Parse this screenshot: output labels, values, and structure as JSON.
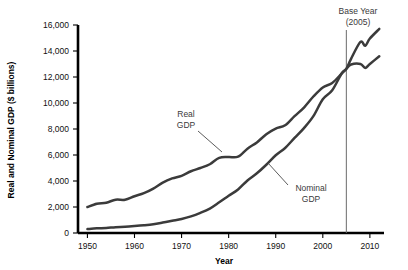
{
  "chart_data": {
    "type": "line",
    "title": "",
    "xlabel": "Year",
    "ylabel": "Real and Nominal GDP ($ billions)",
    "xlim": [
      1948,
      2013
    ],
    "ylim": [
      0,
      16000
    ],
    "xticks": [
      1950,
      1960,
      1970,
      1980,
      1990,
      2000,
      2010
    ],
    "xtick_labels": [
      "1950",
      "1960",
      "1970",
      "1980",
      "1990",
      "2000",
      "2010"
    ],
    "yticks": [
      0,
      2000,
      4000,
      6000,
      8000,
      10000,
      12000,
      14000,
      16000
    ],
    "ytick_labels": [
      "0",
      "2,000",
      "4,000",
      "6,000",
      "8,000",
      "10,000",
      "12,000",
      "14,000",
      "16,000"
    ],
    "grid": false,
    "legend_position": "inline-annotations",
    "line_color": "#3b3b3b",
    "reference_line_color": "#6a6a6a",
    "annotations": [
      {
        "name": "base-year",
        "text_line1": "Base Year",
        "text_line2": "(2005)",
        "x": 2005
      },
      {
        "name": "real-gdp",
        "text_line1": "Real",
        "text_line2": "GDP"
      },
      {
        "name": "nominal-gdp",
        "text_line1": "Nominal",
        "text_line2": "GDP"
      }
    ],
    "series": [
      {
        "name": "Real GDP",
        "x": [
          1950,
          1952,
          1954,
          1956,
          1958,
          1960,
          1962,
          1964,
          1966,
          1968,
          1970,
          1972,
          1974,
          1976,
          1978,
          1980,
          1982,
          1984,
          1986,
          1988,
          1990,
          1992,
          1994,
          1996,
          1998,
          2000,
          2002,
          2004,
          2005,
          2006,
          2008,
          2009,
          2010,
          2012
        ],
        "values": [
          2000,
          2250,
          2330,
          2560,
          2560,
          2830,
          3070,
          3420,
          3880,
          4200,
          4400,
          4750,
          5000,
          5290,
          5780,
          5840,
          5870,
          6490,
          6970,
          7600,
          8030,
          8290,
          8990,
          9650,
          10500,
          11200,
          11540,
          12260,
          12620,
          12960,
          13000,
          12700,
          13000,
          13600
        ]
      },
      {
        "name": "Nominal GDP",
        "x": [
          1950,
          1952,
          1954,
          1956,
          1958,
          1960,
          1962,
          1964,
          1966,
          1968,
          1970,
          1972,
          1974,
          1976,
          1978,
          1980,
          1982,
          1984,
          1986,
          1988,
          1990,
          1992,
          1994,
          1996,
          1998,
          2000,
          2002,
          2004,
          2005,
          2006,
          2008,
          2009,
          2010,
          2012
        ],
        "values": [
          300,
          360,
          390,
          450,
          480,
          530,
          590,
          670,
          800,
          940,
          1080,
          1280,
          1550,
          1880,
          2360,
          2860,
          3350,
          4040,
          4590,
          5250,
          5980,
          6540,
          7310,
          8070,
          8990,
          10290,
          10980,
          12270,
          12620,
          13400,
          14700,
          14400,
          14960,
          15700
        ]
      }
    ]
  },
  "axis": {
    "ylabel": "Real and Nominal GDP ($ billions)",
    "xlabel": "Year"
  }
}
